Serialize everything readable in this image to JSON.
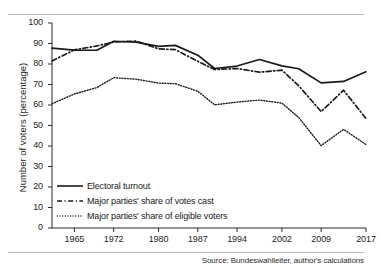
{
  "chart_data": {
    "type": "line",
    "title": "",
    "xlabel": "",
    "ylabel": "Number of voters (percentage)",
    "ylim": [
      0,
      100
    ],
    "xlim": [
      1961,
      2017
    ],
    "grid": false,
    "legend_position": "inside-bottom-left",
    "yticks": [
      0,
      10,
      20,
      30,
      40,
      50,
      60,
      70,
      80,
      90,
      100
    ],
    "ytick_labels": [
      "0",
      "10",
      "20",
      "30",
      "40",
      "50",
      "60",
      "70",
      "80",
      "90",
      "100"
    ],
    "xticks": [
      1965,
      1972,
      1980,
      1987,
      1994,
      2002,
      2009,
      2017
    ],
    "xtick_labels": [
      "1965",
      "1972",
      "1980",
      "1987",
      "1994",
      "2002",
      "2009",
      "2017"
    ],
    "x": [
      1961,
      1965,
      1969,
      1972,
      1976,
      1980,
      1983,
      1987,
      1990,
      1994,
      1998,
      2002,
      2005,
      2009,
      2013,
      2017
    ],
    "series": [
      {
        "name": "Electoral turnout",
        "style": "solid",
        "color": "#1a1a1a",
        "values": [
          87.7,
          86.8,
          86.7,
          91.1,
          90.7,
          88.6,
          89.1,
          84.3,
          77.8,
          79.0,
          82.2,
          79.1,
          77.7,
          70.8,
          71.5,
          76.2
        ]
      },
      {
        "name": "Major parties' share of votes cast",
        "style": "dashed",
        "color": "#1a1a1a",
        "values": [
          81.5,
          86.9,
          88.8,
          90.7,
          91.2,
          87.4,
          87.0,
          81.3,
          77.3,
          77.8,
          76.0,
          77.0,
          69.4,
          56.8,
          67.2,
          53.4
        ]
      },
      {
        "name": "Major parties' share of eligible voters",
        "style": "dotted",
        "color": "#1a1a1a",
        "values": [
          60.6,
          65.4,
          68.5,
          73.3,
          72.6,
          70.7,
          70.4,
          66.7,
          60.1,
          61.4,
          62.4,
          60.9,
          53.9,
          40.2,
          48.1,
          40.7
        ]
      }
    ],
    "source_note": "Source: Bundeswahlleiter, author's calculations"
  },
  "legend": {
    "items": [
      {
        "label": "Electoral turnout"
      },
      {
        "label": "Major parties' share of votes cast"
      },
      {
        "label": "Major parties' share of eligible voters"
      }
    ]
  },
  "source": {
    "text": "Source: Bundeswahlleiter, author's calculations"
  },
  "axes": {
    "y_title": "Number of voters (percentage)"
  }
}
